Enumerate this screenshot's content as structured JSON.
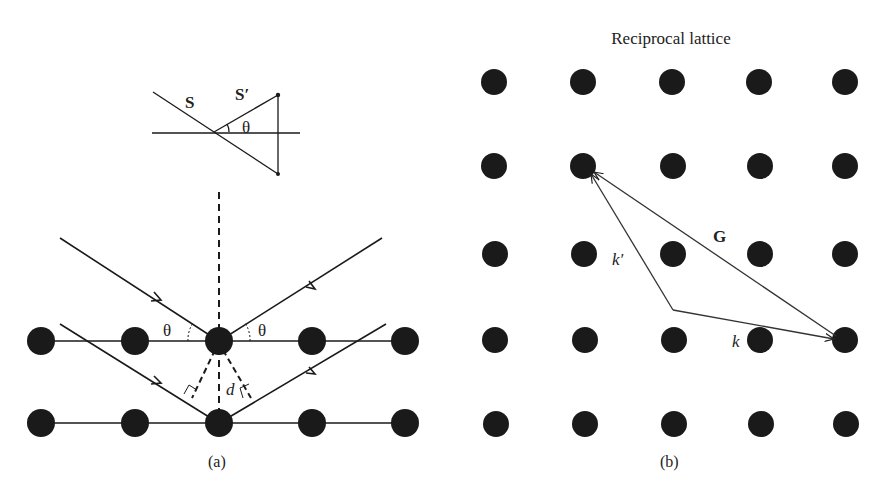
{
  "panel_a": {
    "caption": "(a)",
    "inset": {
      "incident_label": "S",
      "scattered_label": "S′",
      "angle_label": "θ"
    },
    "angle_left_label": "θ",
    "angle_right_label": "θ",
    "spacing_label": "d",
    "rows": 2,
    "atoms_per_row": 5
  },
  "panel_b": {
    "title": "Reciprocal lattice",
    "caption": "(b)",
    "grid": {
      "rows": 5,
      "cols": 5
    },
    "vector_G_label": "G",
    "vector_k_label": "k",
    "vector_kprime_label": "k′"
  },
  "colors": {
    "ink": "#1a1a1a",
    "background": "#ffffff"
  }
}
